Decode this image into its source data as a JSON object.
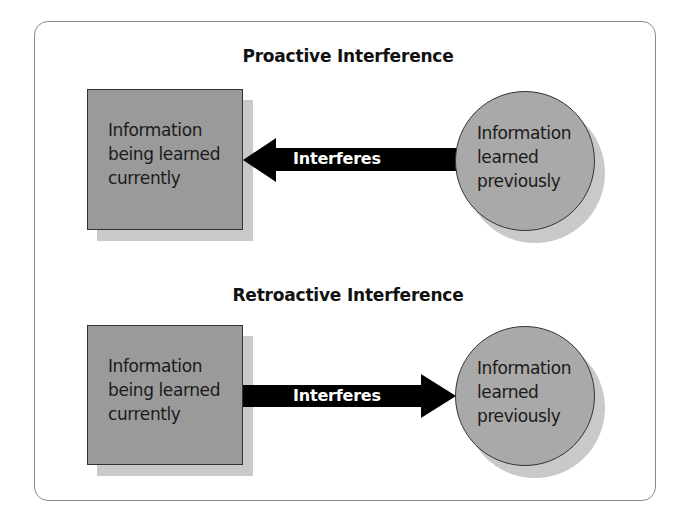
{
  "diagram": {
    "proactive": {
      "title": "Proactive Interference",
      "box": {
        "lines": [
          "Information",
          "being learned",
          "currently"
        ]
      },
      "circle": {
        "lines": [
          "Information",
          "learned",
          "previously"
        ]
      },
      "arrow": {
        "label": "Interferes",
        "direction": "left"
      }
    },
    "retroactive": {
      "title": "Retroactive Interference",
      "box": {
        "lines": [
          "Information",
          "being learned",
          "currently"
        ]
      },
      "circle": {
        "lines": [
          "Information",
          "learned",
          "previously"
        ]
      },
      "arrow": {
        "label": "Interferes",
        "direction": "right"
      }
    },
    "colors": {
      "box_fill": "#9a9a9a",
      "circle_fill": "#a9a9a9",
      "shadow": "#c9c9c9",
      "arrow": "#000000",
      "border": "#333333"
    }
  }
}
